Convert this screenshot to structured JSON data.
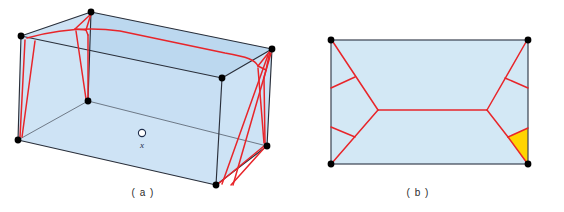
{
  "figure": {
    "background_color": "#ffffff",
    "panels": [
      {
        "id": "a",
        "caption": "( a )",
        "caption_x": 143,
        "caption_y": 196,
        "type": "3d-box-cut-locus",
        "description": "Axonometric rectangular box with light blue translucent faces, black vertices and a red cut-locus network on its surface",
        "point_marker": {
          "label": "x",
          "marker": "open-circle",
          "cx": 142,
          "cy": 133,
          "r": 3.6,
          "label_x": 142,
          "label_y": 148
        },
        "colors": {
          "face_light": "#d9e9f7",
          "face_mid": "#cfe3f4",
          "face_dark": "#b9d6ee",
          "face_floor": "#c6dff3",
          "edge": "#2a2f3a",
          "cut_locus": "#e8252a",
          "vertex": "#000000"
        },
        "box_vertices": {
          "front_top_left": [
            21,
            36
          ],
          "front_top_right": [
            222,
            78
          ],
          "back_top_left": [
            91,
            12
          ],
          "back_top_right": [
            272,
            49
          ],
          "front_bottom_left": [
            18,
            140
          ],
          "front_bottom_right": [
            216,
            185
          ],
          "back_bottom_left": [
            88,
            101
          ],
          "back_bottom_right": [
            267,
            146
          ]
        },
        "vertex_count": 8,
        "cut_locus_color": "#e8252a"
      },
      {
        "id": "b",
        "caption": "( b )",
        "caption_x": 418,
        "caption_y": 196,
        "type": "2d-rectangle-cut-locus",
        "description": "Unfolded rectangle with light blue fill, black corner vertices, red medial-axis / cut-locus skeleton and one yellow shaded triangular region at the lower right",
        "rect": {
          "x": 331,
          "y": 40,
          "width": 197,
          "height": 124
        },
        "colors": {
          "face": "#d3e8f5",
          "edge": "#3a4250",
          "cut_locus": "#e8252a",
          "highlight": "#ffd400",
          "vertex": "#000000"
        },
        "rect_vertices": {
          "top_left": [
            331,
            40
          ],
          "top_right": [
            528,
            40
          ],
          "bottom_left": [
            331,
            164
          ],
          "bottom_right": [
            528,
            164
          ]
        },
        "vertex_count": 4,
        "highlight_region": {
          "name": "yellow-triangle",
          "color": "#ffd400",
          "points": "508,137 528,128 528,164"
        }
      }
    ]
  }
}
